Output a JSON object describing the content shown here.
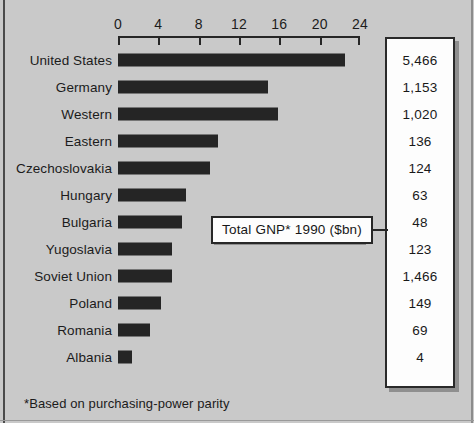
{
  "colors": {
    "background": "#c9c9c9",
    "bar": "#252525",
    "axis": "#262626",
    "panel_fill": "#fdfdfd",
    "panel_border": "#2a2a2a",
    "shadow": "#8f8f8f",
    "text": "#1b1b1b"
  },
  "callout": {
    "label": "Total GNP* 1990 ($bn)"
  },
  "footnote": {
    "text": "*Based on purchasing-power parity"
  },
  "axis": {
    "ticks": [
      "0",
      "4",
      "8",
      "12",
      "16",
      "20",
      "24"
    ]
  },
  "chart_data": {
    "type": "bar",
    "orientation": "horizontal",
    "title": "",
    "subtitle": "",
    "xlabel": "",
    "ylabel": "",
    "xlim": [
      0,
      24
    ],
    "xticks": [
      0,
      4,
      8,
      12,
      16,
      20,
      24
    ],
    "grid": false,
    "legend": null,
    "annotations": [
      "Total GNP* 1990 ($bn)",
      "*Based on purchasing-power parity"
    ],
    "value_column_header": "Total GNP* 1990 ($bn)",
    "categories": [
      "United States",
      "Germany",
      "Western",
      "Eastern",
      "Czechoslovakia",
      "Hungary",
      "Bulgaria",
      "Yugoslavia",
      "Soviet Union",
      "Poland",
      "Romania",
      "Albania"
    ],
    "values": [
      22.5,
      14.9,
      15.9,
      9.9,
      9.1,
      6.7,
      6.3,
      5.4,
      5.4,
      4.3,
      3.2,
      1.4
    ],
    "value_labels": [
      "5,466",
      "1,153",
      "1,020",
      "136",
      "124",
      "63",
      "48",
      "123",
      "1,466",
      "149",
      "69",
      "4"
    ],
    "series": [
      {
        "name": "GNP per head 1990 ($'000, PPP)",
        "values": [
          22.5,
          14.9,
          15.9,
          9.9,
          9.1,
          6.7,
          6.3,
          5.4,
          5.4,
          4.3,
          3.2,
          1.4
        ]
      }
    ]
  }
}
